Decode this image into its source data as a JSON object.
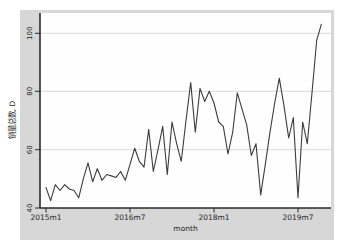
{
  "window": {
    "background": "#ffffff",
    "panel_background": "#d7d7d7",
    "plot_background": "#fefefe"
  },
  "chart_data": {
    "type": "line",
    "title": "",
    "xlabel": "month",
    "ylabel": "销量总数, D",
    "grid": true,
    "gridline_values": [
      60,
      80,
      100
    ],
    "gridline_color": "#d9d9d9",
    "axis_color": "#2b2b2b",
    "x_axis": {
      "tick_labels": [
        "2015m1",
        "2016m7",
        "2018m1",
        "2019m7"
      ],
      "tick_month_indices": [
        0,
        18,
        36,
        54
      ],
      "range_start": "2015m1",
      "range_end": "2019m12",
      "frequency": "monthly"
    },
    "y_axis": {
      "ticks": [
        40,
        60,
        80,
        100
      ],
      "range": [
        40,
        105
      ],
      "label_angle_deg": -90
    },
    "series": [
      {
        "name": "销量总数, D",
        "color": "#3c3c3c",
        "x_months": [
          "2015m1",
          "2015m2",
          "2015m3",
          "2015m4",
          "2015m5",
          "2015m6",
          "2015m7",
          "2015m8",
          "2015m9",
          "2015m10",
          "2015m11",
          "2015m12",
          "2016m1",
          "2016m2",
          "2016m3",
          "2016m4",
          "2016m5",
          "2016m6",
          "2016m7",
          "2016m8",
          "2016m9",
          "2016m10",
          "2016m11",
          "2016m12",
          "2017m1",
          "2017m2",
          "2017m3",
          "2017m4",
          "2017m5",
          "2017m6",
          "2017m7",
          "2017m8",
          "2017m9",
          "2017m10",
          "2017m11",
          "2017m12",
          "2018m1",
          "2018m2",
          "2018m3",
          "2018m4",
          "2018m5",
          "2018m6",
          "2018m7",
          "2018m8",
          "2018m9",
          "2018m10",
          "2018m11",
          "2018m12",
          "2019m1",
          "2019m2",
          "2019m3",
          "2019m4",
          "2019m5",
          "2019m6",
          "2019m7",
          "2019m8",
          "2019m9",
          "2019m10",
          "2019m11",
          "2019m12"
        ],
        "values": [
          47,
          42.5,
          48,
          46,
          48,
          46.5,
          46,
          43.5,
          50,
          55.5,
          49,
          53.5,
          49.5,
          51.5,
          51,
          50.5,
          52.5,
          49.5,
          55,
          60.5,
          56,
          54,
          67,
          52.5,
          60,
          68,
          51.5,
          69.5,
          62,
          56,
          70,
          83,
          66,
          81,
          76.5,
          80,
          76,
          69.5,
          68,
          58.5,
          66,
          79.5,
          74,
          68.5,
          58,
          62,
          44.5,
          55,
          66,
          76,
          84.5,
          75,
          64,
          71,
          43.5,
          69.5,
          62,
          79.5,
          97.5,
          103
        ]
      }
    ]
  }
}
